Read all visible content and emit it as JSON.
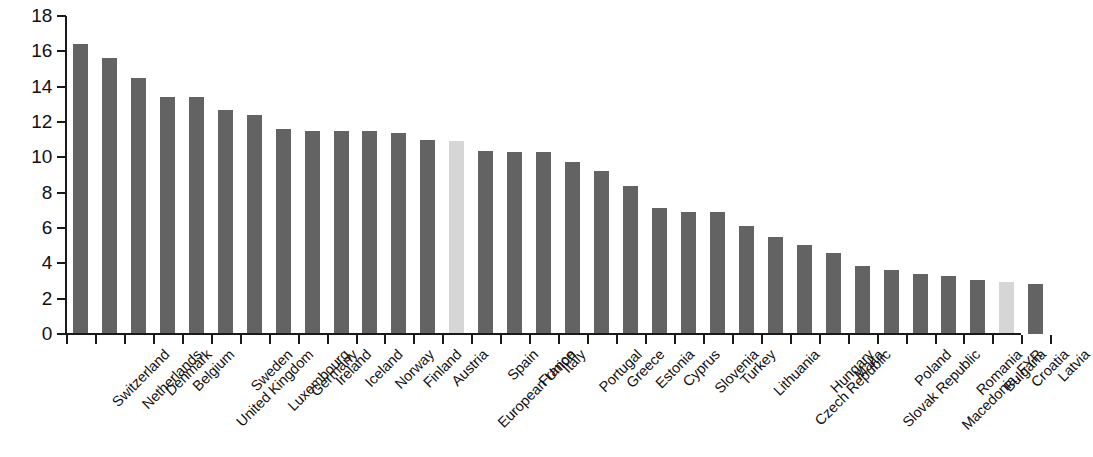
{
  "chart_data": {
    "type": "bar",
    "title": "",
    "subtitle": "",
    "xlabel": "",
    "ylabel": "",
    "ylim": [
      0,
      18
    ],
    "y_ticks": [
      0,
      2,
      4,
      6,
      8,
      10,
      12,
      14,
      16,
      18
    ],
    "grid": false,
    "legend": "none",
    "x_tick_rotation": -45,
    "colors": {
      "bar": "#636363",
      "bar_highlight": "#d6d6d6",
      "axis": "#1a1a1a",
      "text": "#111111",
      "background": "#ffffff"
    },
    "categories": [
      "Switzerland",
      "Netherlands",
      "Denmark",
      "Belgium",
      "United Kingdom",
      "Sweden",
      "Luxembourg",
      "Germany",
      "Ireland",
      "Iceland",
      "Norway",
      "Finland",
      "Austria",
      "European Union",
      "Spain",
      "France",
      "Italy",
      "Portugal",
      "Greece",
      "Estonia",
      "Cyprus",
      "Slovenia",
      "Turkey",
      "Lithuania",
      "Czech Republic",
      "Hungary",
      "Malta",
      "Slovak Republic",
      "Poland",
      "Macedonia, FYR",
      "Romania",
      "Bulgaria",
      "Croatia",
      "Latvia"
    ],
    "values": [
      16.4,
      15.6,
      14.5,
      13.4,
      13.4,
      12.7,
      12.4,
      11.6,
      11.5,
      11.5,
      11.5,
      11.4,
      11.0,
      10.9,
      10.35,
      10.3,
      10.3,
      9.75,
      9.2,
      8.4,
      7.15,
      6.9,
      6.9,
      6.1,
      5.5,
      5.05,
      4.6,
      3.85,
      3.65,
      3.4,
      3.3,
      3.05,
      2.95,
      2.85
    ],
    "highlighted": [
      "European Union",
      "Croatia"
    ]
  }
}
